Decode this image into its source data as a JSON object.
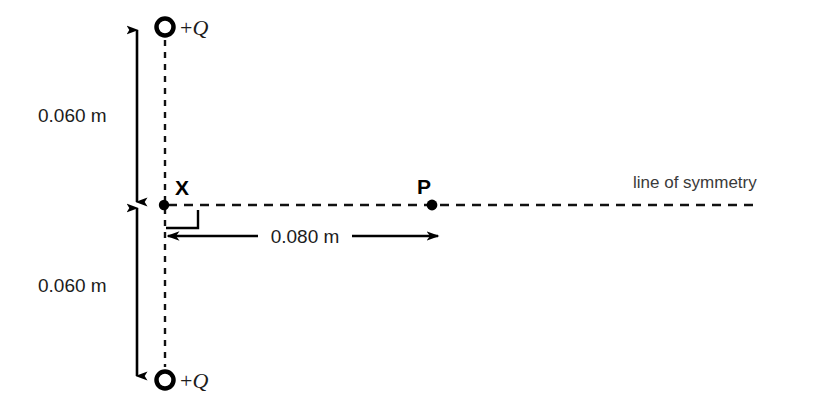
{
  "figure": {
    "type": "physics-diagram",
    "title_visible": false,
    "background_color": "#ffffff",
    "stroke_color": "#000000",
    "text_color": "#1c1c1c",
    "caption_color": "#3a3a3a"
  },
  "charges": {
    "top": {
      "label_plus": "+",
      "label_symbol": "Q",
      "marker": "hollow-circle",
      "x": 165,
      "y": 27
    },
    "bottom": {
      "label_plus": "+",
      "label_symbol": "Q",
      "marker": "hollow-circle",
      "x": 165,
      "y": 380
    }
  },
  "points": {
    "x_point": {
      "label": "X",
      "marker": "filled-dot",
      "x": 164,
      "y": 205
    },
    "p_point": {
      "label": "P",
      "marker": "filled-dot",
      "x": 432,
      "y": 205
    }
  },
  "dimensions": {
    "upper_vertical": {
      "label": "0.060 m",
      "from_y": 27,
      "to_y": 205,
      "arrow_x": 137
    },
    "lower_vertical": {
      "label": "0.060 m",
      "from_y": 205,
      "to_y": 380,
      "arrow_x": 137
    },
    "horizontal": {
      "label": "0.080 m",
      "from_x": 165,
      "to_x": 440,
      "line_y": 236
    }
  },
  "annotations": {
    "symmetry_line": {
      "label": "line of symmetry",
      "style": "dashed",
      "y": 205,
      "from_x": 165,
      "to_x": 755
    },
    "right_angle": {
      "label": "right-angle-marker",
      "x": 166,
      "y": 210,
      "size": 18
    },
    "vertical_dashed_axis": {
      "style": "dashed",
      "x": 165,
      "from_y": 14,
      "to_y": 396
    }
  }
}
